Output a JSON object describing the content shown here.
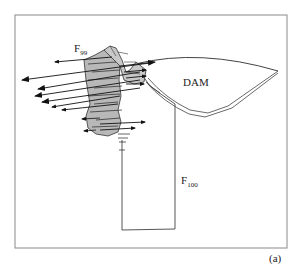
{
  "figure": {
    "panel_label": "(a)",
    "labels": {
      "dam": "DAM",
      "f99": {
        "main": "F",
        "sub": "99"
      },
      "f100": {
        "main": "F",
        "sub": "100"
      }
    },
    "colors": {
      "frame": "#8a8a8a",
      "body_fill": "#b8b8b8",
      "line": "#333333",
      "arrow": "#111111",
      "background": "#ffffff"
    }
  }
}
